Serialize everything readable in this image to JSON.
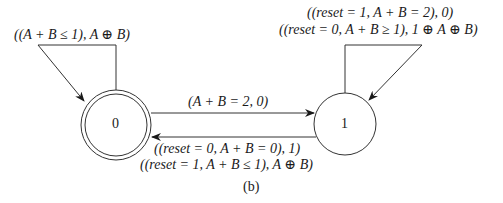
{
  "diagram": {
    "caption": "(b)",
    "states": [
      {
        "id": "0",
        "label": "0",
        "accepting": true
      },
      {
        "id": "1",
        "label": "1",
        "accepting": false
      }
    ],
    "transitions": {
      "self_0": {
        "label": "((A + B ≤ 1), A ⊕ B)"
      },
      "self_1": {
        "lines": [
          "((reset = 1, A + B = 2), 0)",
          "((reset = 0, A + B ≥ 1), 1 ⊕ A ⊕ B)"
        ]
      },
      "zero_to_one": {
        "label": "(A + B = 2, 0)"
      },
      "one_to_zero": {
        "lines": [
          "((reset = 0, A + B = 0), 1)",
          "((reset = 1, A + B ≤ 1), A ⊕ B)"
        ]
      }
    }
  }
}
